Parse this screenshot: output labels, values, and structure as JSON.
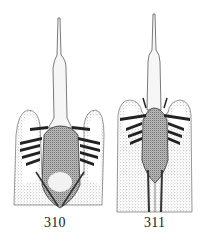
{
  "figures": [
    {
      "number": "310",
      "subject": "genitalia-illustration-left"
    },
    {
      "number": "311",
      "subject": "genitalia-illustration-right"
    }
  ],
  "colors": {
    "ink": "#1a1a1a",
    "stipple": "#6e6e6e",
    "paper": "#ffffff"
  }
}
